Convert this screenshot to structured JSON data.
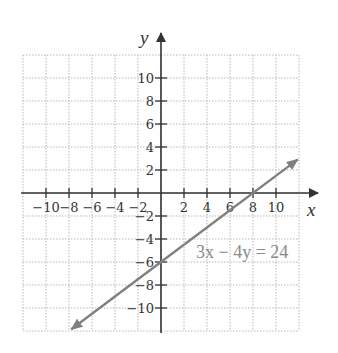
{
  "chart_data": {
    "type": "line",
    "title": "",
    "xlabel": "x",
    "ylabel": "y",
    "xlim": [
      -12,
      12
    ],
    "ylim": [
      -12,
      12
    ],
    "grid": true,
    "grid_step": 2,
    "x_ticks": [
      -10,
      -8,
      -6,
      -4,
      -2,
      2,
      4,
      6,
      8,
      10
    ],
    "y_ticks": [
      10,
      8,
      6,
      4,
      2,
      -2,
      -4,
      -6,
      -8,
      -10
    ],
    "x_tick_labels": [
      "−10",
      "−8",
      "−6",
      "−4",
      "−2",
      "2",
      "4",
      "6",
      "8",
      "10"
    ],
    "y_tick_labels": [
      "10",
      "8",
      "6",
      "4",
      "2",
      "−2",
      "−4",
      "−6",
      "−8",
      "−10"
    ],
    "series": [
      {
        "name": "3x − 4y = 24",
        "equation": "3x - 4y = 24",
        "slope": 0.75,
        "y_intercept": -6,
        "x_intercept": 8,
        "x": [
          -7.8,
          0,
          8,
          11.9
        ],
        "y": [
          -11.85,
          -6,
          0,
          2.9
        ],
        "arrows": "both",
        "color": "#808080"
      }
    ],
    "annotations": [
      {
        "text": "3x − 4y = 24",
        "x": 3,
        "y": -5.7
      }
    ]
  },
  "labels": {
    "x_axis": "x",
    "y_axis": "y",
    "equation": "3x − 4y = 24"
  },
  "colors": {
    "axis": "#333333",
    "grid": "#b8b8b8",
    "line": "#808080",
    "equation_text": "#8a8a8a"
  }
}
